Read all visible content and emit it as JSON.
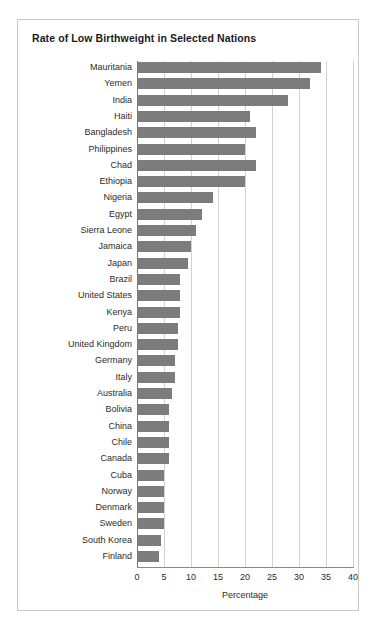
{
  "card": {
    "title": "Rate of Low Birthweight in Selected Nations",
    "border_color": "#c9c9c9",
    "background": "#ffffff"
  },
  "chart_data": {
    "type": "bar",
    "orientation": "horizontal",
    "title": "Rate of Low Birthweight in Selected Nations",
    "xlabel": "Percentage",
    "ylabel": "",
    "xlim": [
      0,
      40
    ],
    "xticks": [
      0,
      5,
      10,
      15,
      20,
      25,
      30,
      35,
      40
    ],
    "grid": "vertical",
    "legend": "none",
    "bar_color": "#7c7c7c",
    "categories": [
      "Mauritania",
      "Yemen",
      "India",
      "Haiti",
      "Bangladesh",
      "Philippines",
      "Chad",
      "Ethiopia",
      "Nigeria",
      "Egypt",
      "Sierra Leone",
      "Jamaica",
      "Japan",
      "Brazil",
      "United States",
      "Kenya",
      "Peru",
      "United Kingdom",
      "Germany",
      "Italy",
      "Australia",
      "Bolivia",
      "China",
      "Chile",
      "Canada",
      "Cuba",
      "Norway",
      "Denmark",
      "Sweden",
      "South Korea",
      "Finland"
    ],
    "values": [
      34.0,
      32.0,
      28.0,
      21.0,
      22.0,
      20.0,
      22.0,
      20.0,
      14.0,
      12.0,
      11.0,
      10.0,
      9.5,
      8.0,
      8.0,
      8.0,
      7.5,
      7.5,
      7.0,
      7.0,
      6.5,
      6.0,
      6.0,
      6.0,
      6.0,
      5.0,
      5.0,
      5.0,
      5.0,
      4.5,
      4.0
    ]
  }
}
